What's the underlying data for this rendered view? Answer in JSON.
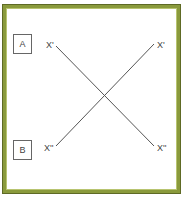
{
  "diagram": {
    "border_color": "#8a9a3c",
    "boxes": [
      {
        "label": "A"
      },
      {
        "label": "B"
      }
    ],
    "labels": {
      "top_left": "X'",
      "top_right": "X'",
      "bottom_left": "X''",
      "bottom_right": "X''"
    },
    "lines": [
      {
        "from": "top_left",
        "to": "bottom_right"
      },
      {
        "from": "bottom_left",
        "to": "top_right"
      }
    ]
  }
}
